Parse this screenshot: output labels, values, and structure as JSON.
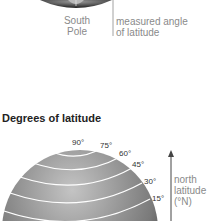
{
  "top_figure": {
    "pole_label_line1": "South",
    "pole_label_line2": "Pole",
    "angle_label_line1": "measured angle",
    "angle_label_line2": "of latitude"
  },
  "bottom_figure": {
    "title": "Degrees of latitude",
    "degree_labels": [
      "90°",
      "75°",
      "60°",
      "45°",
      "30°",
      "15°"
    ],
    "arrow_label_line1": "north",
    "arrow_label_line2": "latitude",
    "arrow_label_line3": "(°N)"
  },
  "colors": {
    "globe_light": "#b5b5b5",
    "globe_dark": "#4a4a4a",
    "lines": "#ffffff",
    "text_grey": "#8a8a8a"
  }
}
